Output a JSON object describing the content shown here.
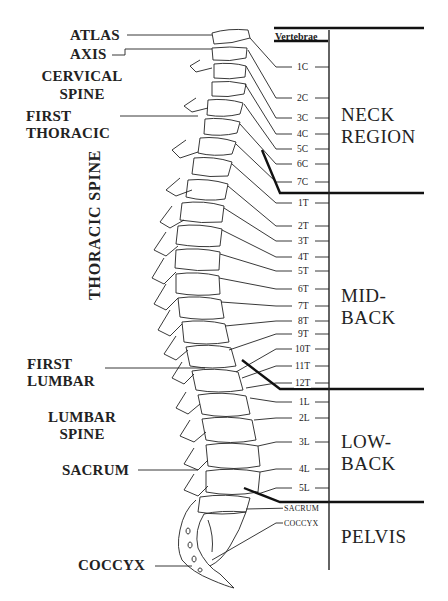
{
  "diagram": {
    "header": "Vertebrae",
    "left_labels": {
      "atlas": "ATLAS",
      "axis": "AXIS",
      "cervical_spine_1": "CERVICAL",
      "cervical_spine_2": "SPINE",
      "first_thoracic_1": "FIRST",
      "first_thoracic_2": "THORACIC",
      "thoracic_spine": "THORACIC SPINE",
      "first_lumbar_1": "FIRST",
      "first_lumbar_2": "LUMBAR",
      "lumbar_spine_1": "LUMBAR",
      "lumbar_spine_2": "SPINE",
      "sacrum": "SACRUM",
      "coccyx": "COCCYX"
    },
    "vertebrae": [
      {
        "label": "1C",
        "y": 67
      },
      {
        "label": "2C",
        "y": 98
      },
      {
        "label": "3C",
        "y": 118
      },
      {
        "label": "4C",
        "y": 134
      },
      {
        "label": "5C",
        "y": 149
      },
      {
        "label": "6C",
        "y": 164
      },
      {
        "label": "7C",
        "y": 182
      },
      {
        "label": "1T",
        "y": 203
      },
      {
        "label": "2T",
        "y": 226
      },
      {
        "label": "3T",
        "y": 241
      },
      {
        "label": "4T",
        "y": 257
      },
      {
        "label": "5T",
        "y": 271
      },
      {
        "label": "6T",
        "y": 289
      },
      {
        "label": "7T",
        "y": 306
      },
      {
        "label": "8T",
        "y": 321
      },
      {
        "label": "9T",
        "y": 334
      },
      {
        "label": "10T",
        "y": 349
      },
      {
        "label": "11T",
        "y": 366
      },
      {
        "label": "12T",
        "y": 383
      },
      {
        "label": "1L",
        "y": 402
      },
      {
        "label": "2L",
        "y": 418
      },
      {
        "label": "3L",
        "y": 442
      },
      {
        "label": "4L",
        "y": 469
      },
      {
        "label": "5L",
        "y": 488
      },
      {
        "label": "SACRUM",
        "y": 508
      },
      {
        "label": "COCCYX",
        "y": 523
      }
    ],
    "regions": [
      {
        "line1": "NECK",
        "line2": "REGION"
      },
      {
        "line1": "MID-",
        "line2": "BACK"
      },
      {
        "line1": "LOW-",
        "line2": "BACK"
      },
      {
        "line1": "PELVIS",
        "line2": ""
      }
    ]
  }
}
